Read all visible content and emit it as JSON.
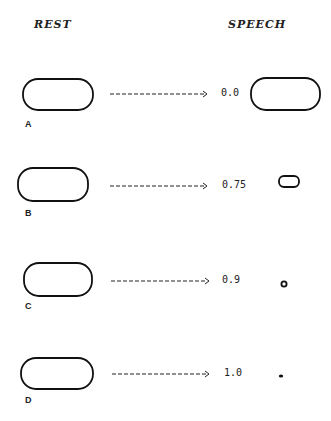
{
  "headers": {
    "rest": "REST",
    "speech": "SPEECH"
  },
  "rows": [
    {
      "label": "A",
      "value": "0.0",
      "arrow": "---------------->"
    },
    {
      "label": "B",
      "value": "0.75",
      "arrow": "---------------->"
    },
    {
      "label": "C",
      "value": "0.9",
      "arrow": "---------------->"
    },
    {
      "label": "D",
      "value": "1.0",
      "arrow": "---------------->"
    }
  ]
}
